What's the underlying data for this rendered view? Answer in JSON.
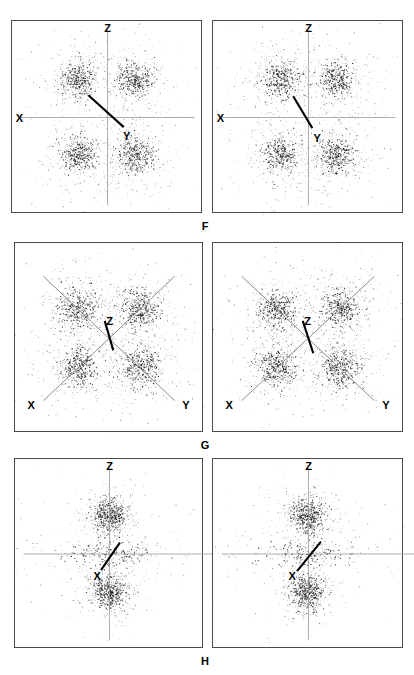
{
  "figure": {
    "kind": "stereographic-pole-figure-grid",
    "background_color": "#ffffff",
    "ink_color": "#1a1a1a",
    "panel_border_color": "#4a4a4a",
    "thin_axis_color": "#9a9a9a",
    "bold_axis_color": "#000000",
    "width": 414,
    "height": 675,
    "rows": [
      {
        "id": "row-f",
        "label": "F",
        "label_x": 205,
        "label_y": 221,
        "panel_top": 20,
        "panel_height": 193,
        "panels": [
          {
            "id": "panel-f-left",
            "x": 11,
            "y": 20,
            "width": 191,
            "height": 193,
            "axes": [
              {
                "name": "Z",
                "kind": "thin-vertical",
                "x1": 0.5,
                "y1": 0.045,
                "x2": 0.5,
                "y2": 0.955,
                "label": "Z",
                "label_x": 0.5,
                "label_y": 0.01,
                "label_anchor": "center-above"
              },
              {
                "name": "X",
                "kind": "thin-horizontal",
                "x1": 0.045,
                "y1": 0.5,
                "x2": 0.955,
                "y2": 0.5,
                "label": "X",
                "label_x": 0.02,
                "label_y": 0.5,
                "label_anchor": "left"
              },
              {
                "name": "Y",
                "kind": "bold-diagonal",
                "x1": 0.4,
                "y1": 0.385,
                "x2": 0.585,
                "y2": 0.55,
                "label": "Y",
                "label_x": 0.6,
                "label_y": 0.575,
                "label_anchor": "right-below"
              }
            ],
            "clusters": [
              {
                "cx": 0.345,
                "cy": 0.305,
                "spread": 0.115,
                "core": 0.044,
                "n": 640
              },
              {
                "cx": 0.645,
                "cy": 0.305,
                "spread": 0.115,
                "core": 0.044,
                "n": 640
              },
              {
                "cx": 0.345,
                "cy": 0.695,
                "spread": 0.115,
                "core": 0.044,
                "n": 640
              },
              {
                "cx": 0.645,
                "cy": 0.695,
                "spread": 0.115,
                "core": 0.044,
                "n": 640
              }
            ],
            "seed": 1101
          },
          {
            "id": "panel-f-right",
            "x": 212,
            "y": 20,
            "width": 191,
            "height": 193,
            "axes": [
              {
                "name": "Z",
                "kind": "thin-vertical",
                "x1": 0.5,
                "y1": 0.045,
                "x2": 0.5,
                "y2": 0.955,
                "label": "Z",
                "label_x": 0.5,
                "label_y": 0.01,
                "label_anchor": "center-above"
              },
              {
                "name": "X",
                "kind": "thin-horizontal",
                "x1": 0.045,
                "y1": 0.5,
                "x2": 0.955,
                "y2": 0.5,
                "label": "X",
                "label_x": 0.02,
                "label_y": 0.5,
                "label_anchor": "left"
              },
              {
                "name": "Y",
                "kind": "bold-diagonal",
                "x1": 0.42,
                "y1": 0.39,
                "x2": 0.52,
                "y2": 0.555,
                "label": "Y",
                "label_x": 0.545,
                "label_y": 0.585,
                "label_anchor": "right-below"
              }
            ],
            "clusters": [
              {
                "cx": 0.355,
                "cy": 0.305,
                "spread": 0.115,
                "core": 0.044,
                "n": 640
              },
              {
                "cx": 0.645,
                "cy": 0.305,
                "spread": 0.115,
                "core": 0.044,
                "n": 640
              },
              {
                "cx": 0.355,
                "cy": 0.695,
                "spread": 0.115,
                "core": 0.044,
                "n": 640
              },
              {
                "cx": 0.645,
                "cy": 0.695,
                "spread": 0.115,
                "core": 0.044,
                "n": 640
              }
            ],
            "seed": 2203
          }
        ]
      },
      {
        "id": "row-g",
        "label": "G",
        "label_x": 205,
        "label_y": 440,
        "panel_top": 242,
        "panel_height": 190,
        "panels": [
          {
            "id": "panel-g-left",
            "x": 14,
            "y": 242,
            "width": 189,
            "height": 190,
            "axes": [
              {
                "name": "X",
                "kind": "thin-diagonal",
                "x1": 0.15,
                "y1": 0.175,
                "x2": 0.845,
                "y2": 0.83,
                "label": "",
                "label_x": 0,
                "label_y": 0,
                "label_anchor": "none"
              },
              {
                "name": "Y",
                "kind": "thin-diagonal",
                "x1": 0.845,
                "y1": 0.175,
                "x2": 0.15,
                "y2": 0.83,
                "label": "",
                "label_x": 0,
                "label_y": 0,
                "label_anchor": "none"
              },
              {
                "name": "X-label",
                "kind": "label-only",
                "label": "X",
                "label_x": 0.085,
                "label_y": 0.855,
                "label_anchor": "center"
              },
              {
                "name": "Y-label",
                "kind": "label-only",
                "label": "Y",
                "label_x": 0.905,
                "label_y": 0.855,
                "label_anchor": "center"
              },
              {
                "name": "Z",
                "kind": "bold-diagonal",
                "x1": 0.475,
                "y1": 0.41,
                "x2": 0.52,
                "y2": 0.565,
                "label": "Z",
                "label_x": 0.5,
                "label_y": 0.385,
                "label_anchor": "center-above"
              }
            ],
            "clusters": [
              {
                "cx": 0.335,
                "cy": 0.345,
                "spread": 0.125,
                "core": 0.05,
                "n": 660
              },
              {
                "cx": 0.665,
                "cy": 0.345,
                "spread": 0.125,
                "core": 0.05,
                "n": 660
              },
              {
                "cx": 0.335,
                "cy": 0.655,
                "spread": 0.125,
                "core": 0.05,
                "n": 660
              },
              {
                "cx": 0.665,
                "cy": 0.655,
                "spread": 0.125,
                "core": 0.05,
                "n": 660
              }
            ],
            "seed": 3307
          },
          {
            "id": "panel-g-right",
            "x": 212,
            "y": 242,
            "width": 191,
            "height": 190,
            "axes": [
              {
                "name": "X",
                "kind": "thin-diagonal",
                "x1": 0.15,
                "y1": 0.175,
                "x2": 0.845,
                "y2": 0.83,
                "label": "",
                "label_x": 0,
                "label_y": 0,
                "label_anchor": "none"
              },
              {
                "name": "Y",
                "kind": "thin-diagonal",
                "x1": 0.845,
                "y1": 0.175,
                "x2": 0.15,
                "y2": 0.83,
                "label": "",
                "label_x": 0,
                "label_y": 0,
                "label_anchor": "none"
              },
              {
                "name": "X-label",
                "kind": "label-only",
                "label": "X",
                "label_x": 0.085,
                "label_y": 0.855,
                "label_anchor": "center"
              },
              {
                "name": "Y-label",
                "kind": "label-only",
                "label": "Y",
                "label_x": 0.905,
                "label_y": 0.855,
                "label_anchor": "center"
              },
              {
                "name": "Z",
                "kind": "bold-diagonal",
                "x1": 0.47,
                "y1": 0.41,
                "x2": 0.525,
                "y2": 0.58,
                "label": "Z",
                "label_x": 0.495,
                "label_y": 0.385,
                "label_anchor": "center-above"
              }
            ],
            "clusters": [
              {
                "cx": 0.335,
                "cy": 0.345,
                "spread": 0.125,
                "core": 0.05,
                "n": 660
              },
              {
                "cx": 0.665,
                "cy": 0.345,
                "spread": 0.125,
                "core": 0.05,
                "n": 660
              },
              {
                "cx": 0.335,
                "cy": 0.655,
                "spread": 0.125,
                "core": 0.05,
                "n": 660
              },
              {
                "cx": 0.665,
                "cy": 0.655,
                "spread": 0.125,
                "core": 0.05,
                "n": 660
              }
            ],
            "seed": 4409
          }
        ]
      },
      {
        "id": "row-h",
        "label": "H",
        "label_x": 205,
        "label_y": 656,
        "panel_top": 458,
        "panel_height": 190,
        "panels": [
          {
            "id": "panel-h-left",
            "x": 14,
            "y": 458,
            "width": 189,
            "height": 190,
            "axes": [
              {
                "name": "Z",
                "kind": "thin-vertical",
                "x1": 0.5,
                "y1": 0.05,
                "x2": 0.5,
                "y2": 0.955,
                "label": "Z",
                "label_x": 0.5,
                "label_y": 0.012,
                "label_anchor": "center-above"
              },
              {
                "name": "Y",
                "kind": "thin-horizontal",
                "x1": 0.045,
                "y1": 0.5,
                "x2": 1.07,
                "y2": 0.5,
                "label": "Y",
                "label_x": 1.1,
                "label_y": 0.5,
                "label_anchor": "right"
              },
              {
                "name": "X",
                "kind": "bold-diagonal",
                "x1": 0.555,
                "y1": 0.44,
                "x2": 0.455,
                "y2": 0.585,
                "label": "X",
                "label_x": 0.435,
                "label_y": 0.615,
                "label_anchor": "center"
              }
            ],
            "clusters": [
              {
                "cx": 0.5,
                "cy": 0.3,
                "spread": 0.085,
                "core": 0.045,
                "n": 760
              },
              {
                "cx": 0.5,
                "cy": 0.7,
                "spread": 0.085,
                "core": 0.045,
                "n": 760
              },
              {
                "cx": 0.5,
                "cy": 0.5,
                "spread": 0.16,
                "core": 0.035,
                "n": 380,
                "anisotropy": 3.2
              }
            ],
            "seed": 5511
          },
          {
            "id": "panel-h-right",
            "x": 212,
            "y": 458,
            "width": 191,
            "height": 190,
            "axes": [
              {
                "name": "Z",
                "kind": "thin-vertical",
                "x1": 0.5,
                "y1": 0.05,
                "x2": 0.5,
                "y2": 0.955,
                "label": "Z",
                "label_x": 0.5,
                "label_y": 0.012,
                "label_anchor": "center-above"
              },
              {
                "name": "Y",
                "kind": "thin-horizontal",
                "x1": 0.045,
                "y1": 0.5,
                "x2": 1.06,
                "y2": 0.5,
                "label": "Y",
                "label_x": 1.095,
                "label_y": 0.5,
                "label_anchor": "right"
              },
              {
                "name": "X",
                "kind": "bold-diagonal",
                "x1": 0.565,
                "y1": 0.435,
                "x2": 0.44,
                "y2": 0.59,
                "label": "X",
                "label_x": 0.415,
                "label_y": 0.615,
                "label_anchor": "center"
              }
            ],
            "clusters": [
              {
                "cx": 0.495,
                "cy": 0.3,
                "spread": 0.085,
                "core": 0.045,
                "n": 760
              },
              {
                "cx": 0.495,
                "cy": 0.7,
                "spread": 0.085,
                "core": 0.045,
                "n": 760
              },
              {
                "cx": 0.495,
                "cy": 0.5,
                "spread": 0.16,
                "core": 0.035,
                "n": 380,
                "anisotropy": 3.2
              }
            ],
            "seed": 6613
          }
        ]
      }
    ]
  }
}
